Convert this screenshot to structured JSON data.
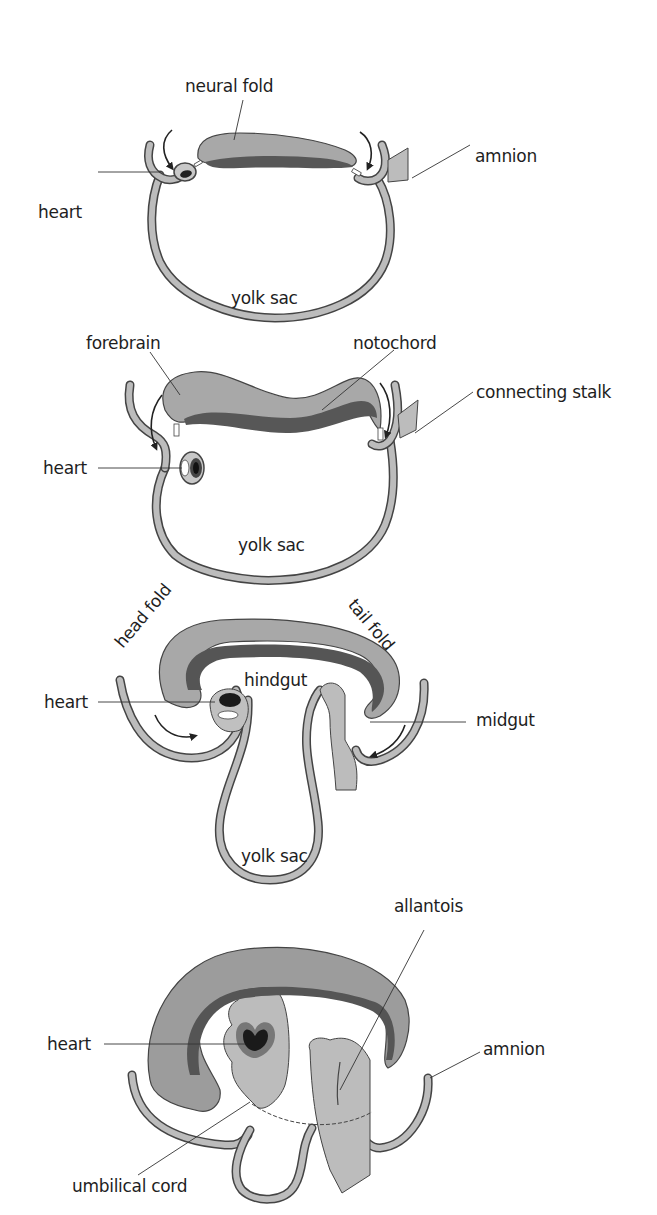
{
  "figure": {
    "colors": {
      "ectoderm_fill": "#b8b8b8",
      "neural_fill": "#9a9a9a",
      "notochord_fill": "#555555",
      "heart_fill": "#1a1a1a",
      "outline": "#444444",
      "background": "#ffffff",
      "text": "#1e1e1e"
    },
    "stages": [
      {
        "id": "stage-1",
        "labels": {
          "neural_fold": "neural fold",
          "amnion": "amnion",
          "heart": "heart",
          "yolk_sac": "yolk sac"
        }
      },
      {
        "id": "stage-2",
        "labels": {
          "forebrain": "forebrain",
          "notochord": "notochord",
          "connecting_stalk": "connecting stalk",
          "heart": "heart",
          "yolk_sac": "yolk sac"
        }
      },
      {
        "id": "stage-3",
        "labels": {
          "head_fold": "head fold",
          "tail_fold": "tail fold",
          "hindgut": "hindgut",
          "heart": "heart",
          "midgut": "midgut",
          "yolk_sac": "yolk sac"
        }
      },
      {
        "id": "stage-4",
        "labels": {
          "allantois": "allantois",
          "heart": "heart",
          "amnion": "amnion",
          "umbilical_cord": "umbilical cord"
        }
      }
    ]
  }
}
